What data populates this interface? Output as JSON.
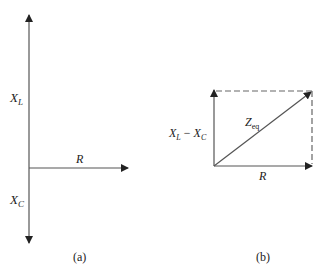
{
  "figure_a": {
    "label_xl_main": "X",
    "label_xl_sub": "L",
    "label_r": "R",
    "label_xc_main": "X",
    "label_xc_sub": "C",
    "caption": "(a)"
  },
  "figure_b": {
    "label_diff_x1": "X",
    "label_diff_s1": "L",
    "label_diff_minus": " − ",
    "label_diff_x2": "X",
    "label_diff_s2": "C",
    "label_z_main": "Z",
    "label_z_sub": "eq",
    "label_r": "R",
    "caption": "(b)"
  },
  "colors": {
    "line": "#444444",
    "text": "#222222"
  }
}
